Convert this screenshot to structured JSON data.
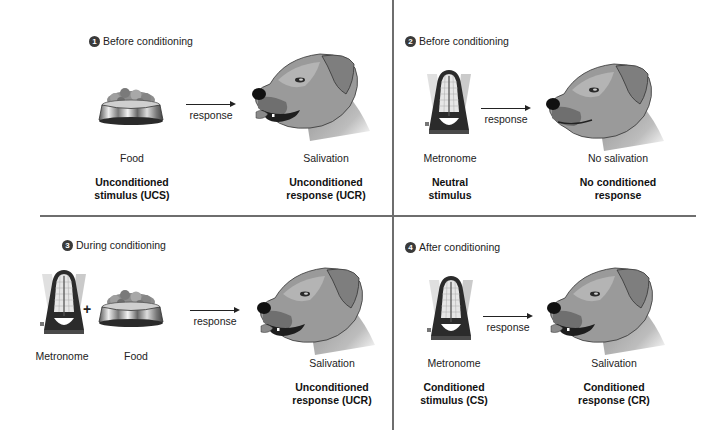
{
  "figure": {
    "panels": [
      {
        "number": "1",
        "heading": "Before conditioning",
        "stimulus_items": [
          "Food"
        ],
        "stimulus_label": [
          "Unconditioned",
          "stimulus (UCS)"
        ],
        "arrow_label": "response",
        "dog_state": "Salivation",
        "response_label": [
          "Unconditioned",
          "response (UCR)"
        ],
        "icons": [
          "food-bowl-icon",
          "dog-head-salivating-icon"
        ]
      },
      {
        "number": "2",
        "heading": "Before conditioning",
        "stimulus_items": [
          "Metronome"
        ],
        "stimulus_label": [
          "Neutral",
          "stimulus"
        ],
        "arrow_label": "response",
        "dog_state": "No salivation",
        "response_label": [
          "No conditioned",
          "response"
        ],
        "icons": [
          "metronome-icon",
          "dog-head-closed-mouth-icon"
        ]
      },
      {
        "number": "3",
        "heading": "During conditioning",
        "stimulus_items": [
          "Metronome",
          "Food"
        ],
        "combine_symbol": "+",
        "arrow_label": "response",
        "dog_state": "Salivation",
        "response_label": [
          "Unconditioned",
          "response (UCR)"
        ],
        "icons": [
          "metronome-icon",
          "food-bowl-icon",
          "dog-head-salivating-icon"
        ]
      },
      {
        "number": "4",
        "heading": "After conditioning",
        "stimulus_items": [
          "Metronome"
        ],
        "stimulus_label": [
          "Conditioned",
          "stimulus (CS)"
        ],
        "arrow_label": "response",
        "dog_state": "Salivation",
        "response_label": [
          "Conditioned",
          "response (CR)"
        ],
        "icons": [
          "metronome-icon",
          "dog-head-salivating-icon"
        ]
      }
    ]
  },
  "colors": {
    "text": "#222222",
    "divider": "#6e6e6e",
    "badge": "#3a3a3a",
    "dog_fur": "#9a9a9a",
    "bowl_metal": "#b8b8b8",
    "metronome_body": "#2b2b2b"
  }
}
